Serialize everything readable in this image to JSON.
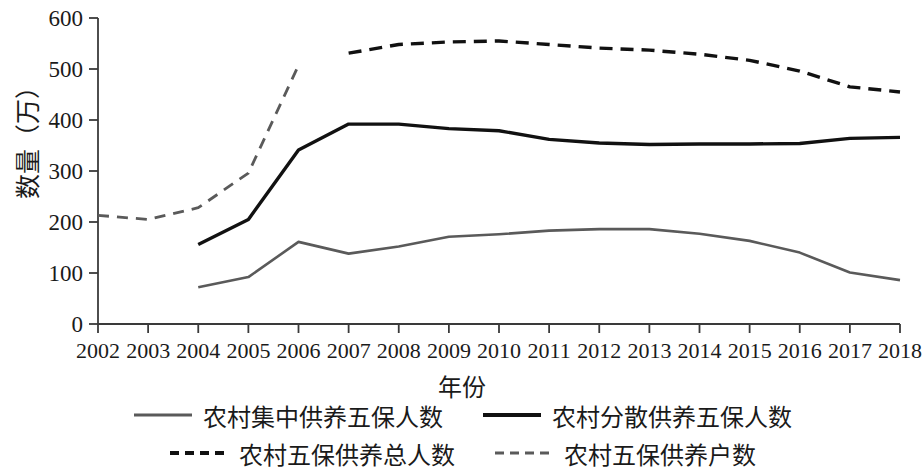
{
  "chart_data": {
    "type": "line",
    "title": "",
    "xlabel": "年份",
    "ylabel": "数量（万）",
    "x": [
      2002,
      2003,
      2004,
      2005,
      2006,
      2007,
      2008,
      2009,
      2010,
      2011,
      2012,
      2013,
      2014,
      2015,
      2016,
      2017,
      2018
    ],
    "xticklabels": [
      "2002",
      "2003",
      "2004",
      "2005",
      "2006",
      "2007",
      "2008",
      "2009",
      "2010",
      "2011",
      "2012",
      "2013",
      "2014",
      "2015",
      "2016",
      "2017",
      "2018"
    ],
    "yticklabels": [
      "0",
      "100",
      "200",
      "300",
      "400",
      "500",
      "600"
    ],
    "yticks": [
      0,
      100,
      200,
      300,
      400,
      500,
      600
    ],
    "ylim": [
      0,
      600
    ],
    "grid": false,
    "legend_position": "bottom",
    "series": [
      {
        "name": "农村集中供养五保人数",
        "color": "#5a5a5a",
        "style": "solid",
        "width": 2.6,
        "x": [
          2004,
          2005,
          2006,
          2007,
          2008,
          2009,
          2010,
          2011,
          2012,
          2013,
          2014,
          2015,
          2016,
          2017,
          2018
        ],
        "values": [
          72,
          92,
          161,
          138,
          152,
          171,
          176,
          183,
          186,
          186,
          177,
          163,
          140,
          101,
          86
        ]
      },
      {
        "name": "农村分散供养五保人数",
        "color": "#111111",
        "style": "solid",
        "width": 3.4,
        "x": [
          2004,
          2005,
          2006,
          2007,
          2008,
          2009,
          2010,
          2011,
          2012,
          2013,
          2014,
          2015,
          2016,
          2017,
          2018
        ],
        "values": [
          156,
          205,
          341,
          392,
          392,
          383,
          379,
          362,
          355,
          352,
          353,
          353,
          354,
          364,
          366
        ]
      },
      {
        "name": "农村五保供养总人数",
        "color": "#111111",
        "style": "dashed",
        "width": 3.4,
        "x": [
          2007,
          2008,
          2009,
          2010,
          2011,
          2012,
          2013,
          2014,
          2015,
          2016,
          2017,
          2018
        ],
        "values": [
          531,
          548,
          553,
          555,
          548,
          541,
          537,
          529,
          517,
          496,
          465,
          455
        ]
      },
      {
        "name": "农村五保供养户数",
        "color": "#5a5a5a",
        "style": "dashed",
        "width": 2.8,
        "x": [
          2002,
          2003,
          2004,
          2005,
          2006
        ],
        "values": [
          213,
          205,
          228,
          296,
          507
        ]
      }
    ]
  },
  "legend": {
    "items": [
      {
        "label": "农村集中供养五保人数",
        "color": "#5a5a5a",
        "style": "solid",
        "thickness": 3
      },
      {
        "label": "农村分散供养五保人数",
        "color": "#111111",
        "style": "solid",
        "thickness": 4
      },
      {
        "label": "农村五保供养总人数",
        "color": "#111111",
        "style": "dashed",
        "thickness": 4
      },
      {
        "label": "农村五保供养户数",
        "color": "#5a5a5a",
        "style": "dashed",
        "thickness": 3
      }
    ]
  }
}
